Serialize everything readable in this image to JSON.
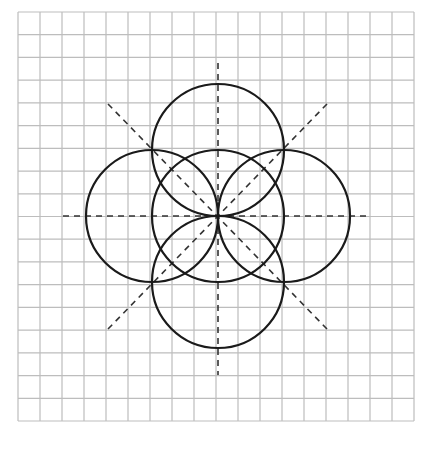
{
  "figure": {
    "title": "",
    "background": "#ffffff",
    "grid": {
      "x0": 18,
      "y0": 12,
      "x1": 414,
      "y1": 421,
      "cols": 18,
      "rows": 18,
      "color": "#bdbdbd",
      "stroke_width": 1.2
    },
    "center": {
      "x": 218,
      "y": 216
    },
    "radius": 66,
    "circle_color": "#1a1a1a",
    "circle_stroke_width": 2.2,
    "circles": [
      {
        "name": "circle-center",
        "cx": 218,
        "cy": 216
      },
      {
        "name": "circle-top",
        "cx": 218,
        "cy": 150
      },
      {
        "name": "circle-bottom",
        "cx": 218,
        "cy": 282
      },
      {
        "name": "circle-left",
        "cx": 152,
        "cy": 216
      },
      {
        "name": "circle-right",
        "cx": 284,
        "cy": 216
      }
    ],
    "dashed_color": "#333333",
    "dashed_stroke_width": 1.6,
    "dash_pattern": "6,5",
    "dashed_lines": [
      {
        "name": "axis-vertical",
        "x1": 218,
        "y1": 63,
        "x2": 218,
        "y2": 375
      },
      {
        "name": "axis-horizontal",
        "x1": 63,
        "y1": 216,
        "x2": 369,
        "y2": 216
      },
      {
        "name": "diagonal-descending",
        "x1": 108,
        "y1": 104,
        "x2": 327,
        "y2": 329
      },
      {
        "name": "diagonal-ascending",
        "x1": 108,
        "y1": 329,
        "x2": 327,
        "y2": 104
      }
    ]
  }
}
